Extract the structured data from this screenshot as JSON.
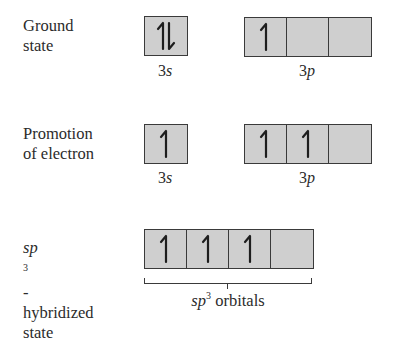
{
  "diagram": {
    "rows": [
      {
        "id": "ground",
        "label_lines": [
          "Ground",
          "state"
        ],
        "groups": [
          {
            "name": "3s",
            "label_num": "3",
            "label_letter": "s",
            "cells": [
              "up-down"
            ]
          },
          {
            "name": "3p",
            "label_num": "3",
            "label_letter": "p",
            "cells": [
              "up",
              "empty",
              "empty"
            ]
          }
        ]
      },
      {
        "id": "promotion",
        "label_lines": [
          "Promotion",
          "of electron"
        ],
        "groups": [
          {
            "name": "3s",
            "label_num": "3",
            "label_letter": "s",
            "cells": [
              "up"
            ]
          },
          {
            "name": "3p",
            "label_num": "3",
            "label_letter": "p",
            "cells": [
              "up",
              "up",
              "empty"
            ]
          }
        ]
      },
      {
        "id": "sp3",
        "label_italic": "sp",
        "label_sup": "3",
        "label_suffix": "-",
        "label_lines": [
          "hybridized",
          "state"
        ],
        "groups": [
          {
            "name": "sp3 orbitals",
            "label_italic": "sp",
            "label_sup": "3",
            "label_rest": " orbitals",
            "cells": [
              "up",
              "up",
              "up",
              "empty"
            ]
          }
        ]
      }
    ],
    "colors": {
      "box_fill": "#cfcfcf",
      "box_border": "#3a3a3a",
      "text": "#2b2b2b",
      "background": "#ffffff"
    },
    "icons": {
      "up": "half-arrow-up-icon",
      "up-down": "paired-arrows-up-down-icon",
      "empty": "empty-orbital"
    }
  }
}
